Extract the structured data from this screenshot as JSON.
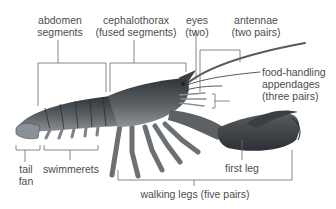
{
  "diagram": {
    "colors": {
      "background": "#ffffff",
      "label_text": "#4d4d4d",
      "leader_line": "#6a6a6a",
      "body_dark": "#3a3f44",
      "body_mid": "#6b7075",
      "body_light": "#9aa0a5"
    },
    "labels": {
      "abdomen": {
        "line1": "abdomen",
        "line2": "segments"
      },
      "cephalothorax": {
        "line1": "cephalothorax",
        "line2": "(fused segments)"
      },
      "eyes": {
        "line1": "eyes",
        "line2": "(two)"
      },
      "antennae": {
        "line1": "antennae",
        "line2": "(two pairs)"
      },
      "food_handling": {
        "line1": "food-handling",
        "line2": "appendages",
        "line3": "(three pairs)"
      },
      "tail_fan": {
        "line1": "tail",
        "line2": "fan"
      },
      "swimmerets": {
        "line1": "swimmerets"
      },
      "first_leg": {
        "line1": "first leg"
      },
      "walking_legs": {
        "line1": "walking legs (five pairs)"
      }
    }
  }
}
